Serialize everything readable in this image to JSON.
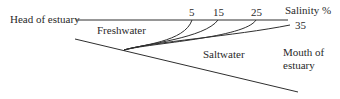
{
  "diagram": {
    "type": "estuary-salinity-profile",
    "labels": {
      "head": "Head of estuary",
      "freshwater": "Freshwater",
      "saltwater": "Saltwater",
      "salinity": "Salinity %",
      "mouth_line1": "Mouth of",
      "mouth_line2": "estuary"
    },
    "isohalines": [
      {
        "value": "5"
      },
      {
        "value": "15"
      },
      {
        "value": "25"
      },
      {
        "value": "35"
      }
    ],
    "colors": {
      "line": "#2f2f2f",
      "text": "#2a2a2a",
      "background": "#ffffff"
    }
  }
}
